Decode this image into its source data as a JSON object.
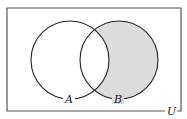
{
  "diagram": {
    "type": "venn",
    "universe_label": "U",
    "sets": [
      {
        "label": "A",
        "cx": 70,
        "cy": 60,
        "r": 39
      },
      {
        "label": "B",
        "cx": 119,
        "cy": 60,
        "r": 39
      }
    ],
    "shaded_region": "B minus A",
    "shade_color": "#dcdcdc",
    "line_color": "#222222"
  }
}
